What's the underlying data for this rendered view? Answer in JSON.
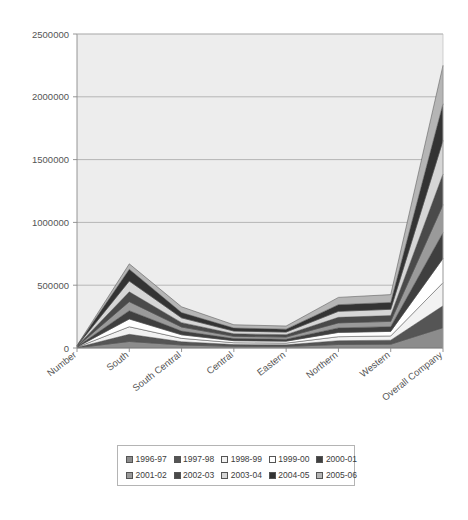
{
  "chart_data": {
    "type": "area",
    "stacked": true,
    "title": "",
    "subtitle": "",
    "xlabel": "",
    "ylabel": "",
    "ylim": [
      0,
      2500000
    ],
    "ytick_labels": [
      "0",
      "500000",
      "1000000",
      "1500000",
      "2000000",
      "2500000"
    ],
    "yticks": [
      0,
      500000,
      1000000,
      1500000,
      2000000,
      2500000
    ],
    "grid": true,
    "grid_axis": "y",
    "legend_position": "bottom",
    "legend_columns": 5,
    "categories": [
      "Number",
      "South",
      "South Central",
      "Central",
      "Eastern",
      "Northern",
      "Western",
      "Overall Company"
    ],
    "series": [
      {
        "name": "1996-97",
        "color": "#8c8c8c",
        "values": [
          2000,
          52000,
          24000,
          13000,
          12000,
          28000,
          30000,
          162000
        ]
      },
      {
        "name": "1997-98",
        "color": "#555555",
        "values": [
          2000,
          57000,
          26000,
          14000,
          13000,
          30000,
          32000,
          174000
        ]
      },
      {
        "name": "1998-99",
        "color": "#f2f2f2",
        "values": [
          2000,
          60000,
          27000,
          15000,
          14000,
          32000,
          34000,
          184000
        ]
      },
      {
        "name": "1999-00",
        "color": "#ffffff",
        "values": [
          2000,
          62000,
          28000,
          16000,
          15000,
          34000,
          36000,
          193000
        ]
      },
      {
        "name": "2000-01",
        "color": "#3f3f3f",
        "values": [
          2000,
          66000,
          30000,
          17000,
          16000,
          36000,
          38000,
          205000
        ]
      },
      {
        "name": "2001-02",
        "color": "#9a9a9a",
        "values": [
          2000,
          72000,
          32000,
          18000,
          17000,
          40000,
          42000,
          223000
        ]
      },
      {
        "name": "2002-03",
        "color": "#4a4a4a",
        "values": [
          2000,
          78000,
          35000,
          20000,
          19000,
          44000,
          46000,
          244000
        ]
      },
      {
        "name": "2003-04",
        "color": "#d6d6d6",
        "values": [
          2000,
          86000,
          38000,
          22000,
          21000,
          48000,
          50000,
          267000
        ]
      },
      {
        "name": "2004-05",
        "color": "#333333",
        "values": [
          2000,
          94000,
          42000,
          24000,
          23000,
          53000,
          55000,
          292000
        ]
      },
      {
        "name": "2005-06",
        "color": "#b5b5b5",
        "values": [
          2000,
          43000,
          46000,
          26000,
          25000,
          58000,
          62000,
          306000
        ]
      }
    ],
    "plot_background": "#ededed",
    "plot_border": "#aaaaaa"
  },
  "legend": {
    "row1": [
      "1996-97",
      "1997-98",
      "1998-99",
      "1999-00",
      "2000-01"
    ],
    "row2": [
      "2001-02",
      "2002-03",
      "2003-04",
      "2004-05",
      "2005-06"
    ]
  }
}
